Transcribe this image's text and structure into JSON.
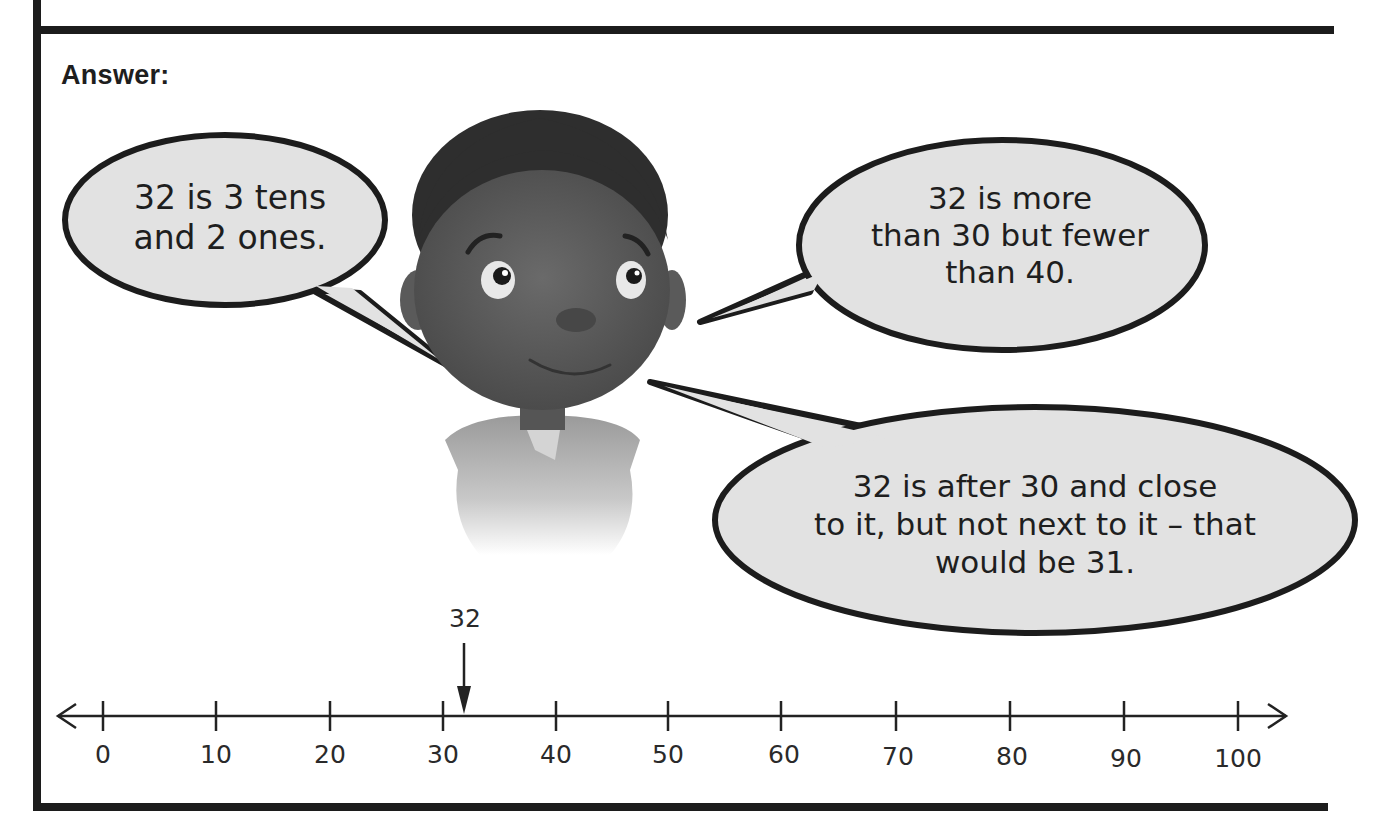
{
  "section": {
    "label": "Answer:"
  },
  "speech_bubbles": [
    {
      "id": "tens-ones",
      "lines": [
        "32 is 3 tens",
        "and 2 ones."
      ]
    },
    {
      "id": "more-fewer",
      "lines": [
        "32 is more",
        "than 30 but fewer",
        "than 40."
      ]
    },
    {
      "id": "after-close",
      "lines": [
        "32 is after 30 and close",
        "to it, but not next to it – that",
        "would be 31."
      ]
    }
  ],
  "character": {
    "description": "cartoon boy illustration (grayscale)"
  },
  "number_line": {
    "min": 0,
    "max": 100,
    "step": 10,
    "ticks": [
      "0",
      "10",
      "20",
      "30",
      "40",
      "50",
      "60",
      "70",
      "80",
      "90",
      "100"
    ],
    "marker": {
      "value": 32,
      "label": "32"
    }
  },
  "colors": {
    "ink": "#1c1c1c",
    "bubble_fill": "#e2e2e2",
    "skin": "#5a5a5a",
    "hair": "#2e2e2e"
  }
}
